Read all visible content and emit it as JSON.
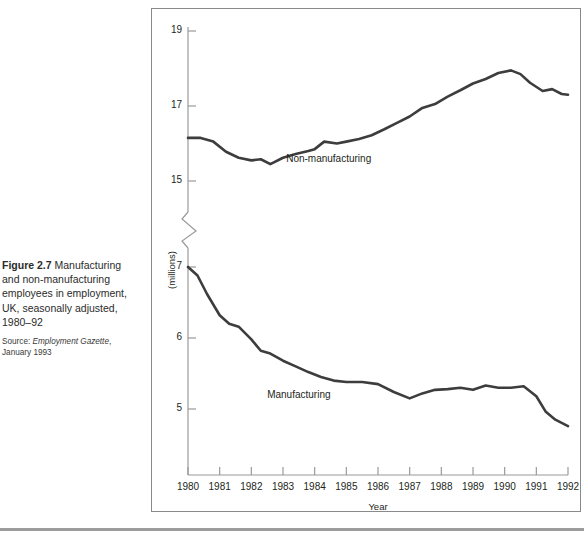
{
  "figure": {
    "label": "Figure 2.7",
    "caption": " Manufacturing and non-manufacturing employees in employment, UK, seasonally adjusted, 1980–92",
    "source_prefix": "Source: ",
    "source_italic": "Employment Gazette",
    "source_suffix": ", January 1993"
  },
  "chart_data": {
    "type": "line",
    "title": "",
    "xlabel": "Year",
    "ylabel": "(millions)",
    "grid": false,
    "legend": "inline-labels",
    "broken_axis": true,
    "axis_break_note": "y-axis broken between 5 (lower panel top region) and 15 (upper panel)",
    "y_upper_ticks": [
      15,
      17,
      19
    ],
    "y_upper_range": [
      14.2,
      19.3
    ],
    "y_lower_ticks": [
      5,
      6,
      7
    ],
    "y_lower_range": [
      4.5,
      7.3
    ],
    "x": [
      1980,
      1981,
      1982,
      1983,
      1984,
      1985,
      1986,
      1987,
      1988,
      1989,
      1990,
      1991,
      1992
    ],
    "xtick_labels": [
      "1980",
      "1981",
      "1982",
      "1983",
      "1984",
      "1985",
      "1986",
      "1987",
      "1988",
      "1989",
      "1990",
      "1991",
      "1992"
    ],
    "series": [
      {
        "name": "Non-manufacturing",
        "panel": "upper",
        "label_x": 1983.1,
        "label_y": 15.55,
        "x": [
          1980.0,
          1980.4,
          1980.8,
          1981.2,
          1981.6,
          1982.0,
          1982.3,
          1982.6,
          1983.0,
          1983.4,
          1983.8,
          1984.0,
          1984.3,
          1984.7,
          1985.0,
          1985.4,
          1985.8,
          1986.2,
          1986.6,
          1987.0,
          1987.4,
          1987.8,
          1988.2,
          1988.6,
          1989.0,
          1989.4,
          1989.8,
          1990.2,
          1990.5,
          1990.8,
          1991.2,
          1991.5,
          1991.8,
          1992.0
        ],
        "values": [
          16.15,
          16.15,
          16.05,
          15.78,
          15.62,
          15.55,
          15.58,
          15.45,
          15.62,
          15.72,
          15.8,
          15.85,
          16.05,
          16.0,
          16.05,
          16.12,
          16.22,
          16.38,
          16.55,
          16.72,
          16.95,
          17.05,
          17.25,
          17.42,
          17.6,
          17.72,
          17.88,
          17.95,
          17.85,
          17.62,
          17.4,
          17.45,
          17.32,
          17.3
        ]
      },
      {
        "name": "Manufacturing",
        "panel": "lower",
        "label_x": 1982.5,
        "label_y": 5.18,
        "x": [
          1980.0,
          1980.3,
          1980.6,
          1981.0,
          1981.3,
          1981.6,
          1982.0,
          1982.3,
          1982.6,
          1983.0,
          1983.4,
          1983.8,
          1984.2,
          1984.6,
          1985.0,
          1985.5,
          1986.0,
          1986.5,
          1987.0,
          1987.4,
          1987.8,
          1988.2,
          1988.6,
          1989.0,
          1989.4,
          1989.8,
          1990.2,
          1990.6,
          1991.0,
          1991.3,
          1991.6,
          1992.0
        ],
        "values": [
          7.0,
          6.88,
          6.62,
          6.32,
          6.2,
          6.16,
          5.98,
          5.82,
          5.78,
          5.68,
          5.6,
          5.52,
          5.45,
          5.4,
          5.38,
          5.38,
          5.35,
          5.24,
          5.15,
          5.22,
          5.27,
          5.28,
          5.3,
          5.27,
          5.33,
          5.3,
          5.3,
          5.32,
          5.18,
          4.96,
          4.85,
          4.76
        ]
      }
    ]
  },
  "colors": {
    "line": "#3d3d3d",
    "axis": "#8a8a8a",
    "frame": "#8a8a8a",
    "text": "#231f20"
  }
}
